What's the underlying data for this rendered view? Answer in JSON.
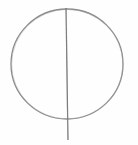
{
  "sketch": {
    "description": "Pencil sketch of a circle bisected by a vertical line",
    "stroke_color": "#8a8a8a",
    "stroke_color_dark": "#6f6f6f",
    "background": "#fefefe",
    "circle": {
      "cx": 67,
      "cy": 64,
      "rx": 56,
      "ry": 55
    },
    "vertical_line": {
      "x1": 66,
      "y1": 8,
      "x2": 68,
      "y2": 140
    }
  }
}
